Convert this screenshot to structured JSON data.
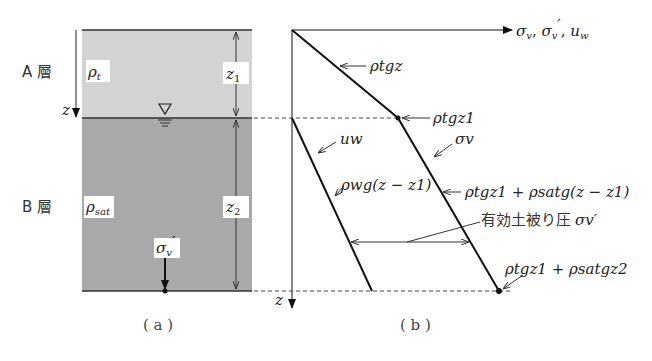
{
  "panel_a": {
    "caption": "( a )",
    "layer_a": {
      "label": "A 層",
      "density_symbol": "ρ",
      "density_sub": "t",
      "fill": "#d3d3d3"
    },
    "layer_b": {
      "label": "B 層",
      "density_symbol": "ρ",
      "density_sub": "sat",
      "fill": "#a9a9a9"
    },
    "depth_axis_label": "z",
    "dim_z1": {
      "sym": "z",
      "sub": "1"
    },
    "dim_z2": {
      "sym": "z",
      "sub": "2"
    },
    "water_table_icon": "water-table-triangle-icon",
    "stress_label": {
      "sym": "σ",
      "sub": "v",
      "prime": "′"
    }
  },
  "panel_b": {
    "caption": "( b )",
    "x_axis_label": "σv, σv′, uw",
    "x_axis_parts": {
      "s1": "σ",
      "s1_sub": "v",
      "sep1": ", ",
      "s2": "σ",
      "s2_sub": "v",
      "s2_prime": "′",
      "sep2": ", ",
      "u": "u",
      "u_sub": "w"
    },
    "y_axis_label": "z",
    "annotations": {
      "upper_line": "ρtgz",
      "kink": "ρtgz1",
      "pore_pressure_name": "uw",
      "pore_pressure_formula": "ρwg(z − z1)",
      "total_stress_name": "σv",
      "total_stress_formula": "ρtgz1 + ρsatg(z − z1)",
      "effective_stress_jp": "有効土被り圧",
      "effective_stress_sym": "σv′",
      "bottom_value": "ρtgz1 + ρsatgz2"
    }
  }
}
